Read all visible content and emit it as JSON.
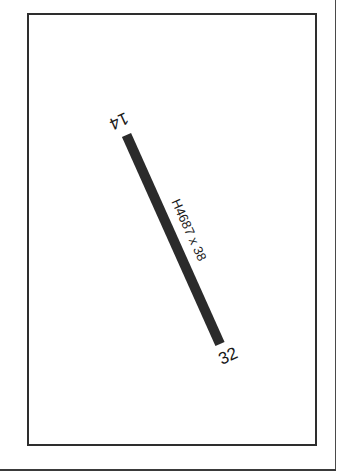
{
  "diagram": {
    "type": "airport-runway-diagram",
    "runway": {
      "designation_start": "14",
      "designation_end": "32",
      "surface_dimensions": "H4687 x 38",
      "color": "#2b2b2b"
    },
    "frame_color": "#2e2e2e",
    "background": "#ffffff"
  }
}
